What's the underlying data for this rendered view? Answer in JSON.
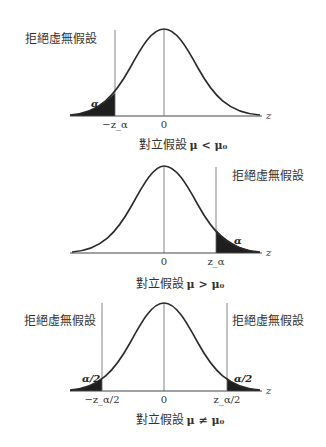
{
  "panels": [
    {
      "name": "left-tailed",
      "reject_label": "拒絕虛無假設",
      "alpha_label": "α",
      "ticks": {
        "critical": "−z_α",
        "center": "0"
      },
      "axis_label": "z",
      "caption_text": "對立假設",
      "caption_math": "μ < μ₀"
    },
    {
      "name": "right-tailed",
      "reject_label": "拒絕虛無假設",
      "alpha_label": "α",
      "ticks": {
        "critical": "z_α",
        "center": "0"
      },
      "axis_label": "z",
      "caption_text": "對立假設",
      "caption_math": "μ > μ₀"
    },
    {
      "name": "two-tailed",
      "reject_label_left": "拒絕虛無假設",
      "reject_label_right": "拒絕虛無假設",
      "alpha_label_left": "α/2",
      "alpha_label_right": "α/2",
      "ticks": {
        "critical_left": "−z_α/2",
        "center": "0",
        "critical_right": "z_α/2"
      },
      "axis_label": "z",
      "caption_text": "對立假設",
      "caption_math": "μ ≠ μ₀"
    }
  ],
  "colors": {
    "curve": "#2a2a2a",
    "fill": "#1e1e1e",
    "line": "#555555"
  }
}
